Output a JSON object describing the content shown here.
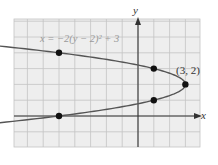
{
  "chart_data": {
    "type": "line",
    "title": "",
    "equation_label": "x = −2(y − 2)² + 3",
    "xlabel": "x",
    "ylabel": "y",
    "xlim": [
      -7.8,
      3.9
    ],
    "ylim": [
      -2,
      6.2
    ],
    "grid": true,
    "grid_step": 1,
    "curve": {
      "name": "x = -2(y - 2)^2 + 3",
      "kind": "parabola opening left",
      "vertex": [
        3,
        2
      ]
    },
    "points": [
      {
        "x": -5,
        "y": 4
      },
      {
        "x": 1,
        "y": 3
      },
      {
        "x": 3,
        "y": 2,
        "label": "(3, 2)"
      },
      {
        "x": 1,
        "y": 1
      },
      {
        "x": -5,
        "y": 0
      }
    ],
    "colors": {
      "grid_bg": "#eeeeee",
      "grid_line": "#c4c4c4",
      "axis": "#333333",
      "curve": "#555555",
      "point": "#111111",
      "equation": "#9a9a9a"
    }
  },
  "labels": {
    "x_axis": "x",
    "y_axis": "y",
    "equation": "x = −2(y − 2)² + 3",
    "vertex": "(3, 2)"
  }
}
